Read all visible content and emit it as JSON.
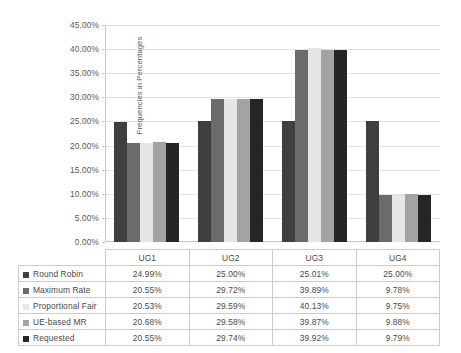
{
  "chart_data": {
    "type": "bar",
    "title": "",
    "subtitle": "",
    "xlabel": "",
    "ylabel": "Frequencies in Percentages",
    "categories": [
      "UG1",
      "UG2",
      "UG3",
      "UG4"
    ],
    "ylim": [
      0,
      45
    ],
    "ytick_step": 5,
    "ytick_labels": [
      "0.00%",
      "5.00%",
      "10.00%",
      "15.00%",
      "20.00%",
      "25.00%",
      "30.00%",
      "35.00%",
      "40.00%",
      "45.00%"
    ],
    "ytick_values": [
      0,
      5,
      10,
      15,
      20,
      25,
      30,
      35,
      40,
      45
    ],
    "grid": true,
    "legend_position": "data-table-below",
    "series": [
      {
        "name": "Round Robin",
        "color": "#3f3f3f",
        "values": [
          24.99,
          25.0,
          25.01,
          25.0
        ],
        "labels": [
          "24.99%",
          "25.00%",
          "25.01%",
          "25.00%"
        ]
      },
      {
        "name": "Maximum Rate",
        "color": "#6b6b6b",
        "values": [
          20.55,
          29.72,
          39.89,
          9.78
        ],
        "labels": [
          "20.55%",
          "29.72%",
          "39.89%",
          "9.78%"
        ]
      },
      {
        "name": "Proportional Fair",
        "color": "#e6e6e6",
        "values": [
          20.53,
          29.59,
          40.13,
          9.75
        ],
        "labels": [
          "20.53%",
          "29.59%",
          "40.13%",
          "9.75%"
        ]
      },
      {
        "name": "UE-based MR",
        "color": "#a3a3a3",
        "values": [
          20.68,
          29.58,
          39.87,
          9.88
        ],
        "labels": [
          "20.68%",
          "29.58%",
          "39.87%",
          "9.88%"
        ]
      },
      {
        "name": "Requested",
        "color": "#252525",
        "values": [
          20.55,
          29.74,
          39.92,
          9.79
        ],
        "labels": [
          "20.55%",
          "29.74%",
          "39.92%",
          "9.79%"
        ]
      }
    ]
  },
  "table": {
    "corner_label": "",
    "column_headers": [
      "UG1",
      "UG2",
      "UG3",
      "UG4"
    ]
  },
  "colors": {
    "gridline": "#e2e2e2",
    "axis": "#c8c8c8",
    "text": "#4a4a4a",
    "background": "#ffffff"
  }
}
